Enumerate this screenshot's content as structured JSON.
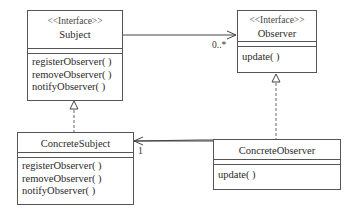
{
  "diagram": {
    "type": "UML class diagram",
    "classes": {
      "subject": {
        "stereotype": "<<Interface>>",
        "name": "Subject",
        "operations": [
          "registerObserver( )",
          "removeObserver( )",
          "notifyObserver( )"
        ]
      },
      "observer": {
        "stereotype": "<<Interface>>",
        "name": "Observer",
        "operations": [
          "update( )"
        ]
      },
      "concrete_subject": {
        "name": "ConcreteSubject",
        "operations": [
          "registerObserver( )",
          "removeObserver( )",
          "notifyObserver( )"
        ]
      },
      "concrete_observer": {
        "name": "ConcreteObserver",
        "operations": [
          "update( )"
        ]
      }
    },
    "relationships": [
      {
        "from": "Subject",
        "to": "Observer",
        "kind": "association",
        "multiplicity": "0..*"
      },
      {
        "from": "ConcreteSubject",
        "to": "Subject",
        "kind": "realization"
      },
      {
        "from": "ConcreteObserver",
        "to": "Observer",
        "kind": "realization"
      },
      {
        "from": "ConcreteObserver",
        "to": "ConcreteSubject",
        "kind": "association",
        "multiplicity": "1"
      }
    ],
    "multiplicities": {
      "observer_end": "0..*",
      "subject_end": "1"
    }
  }
}
